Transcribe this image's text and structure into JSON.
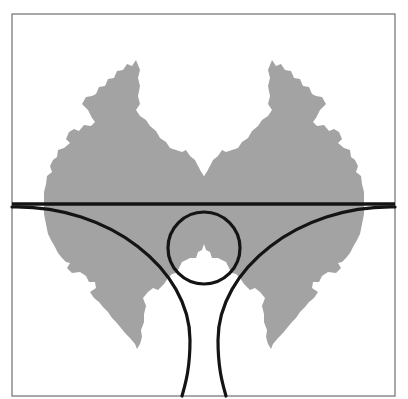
{
  "figure": {
    "colors": {
      "background": "#ffffff",
      "frame": "#6f6f6f",
      "fractal_fill": "#a3a3a3",
      "curves": "#141414"
    },
    "frame": {
      "x": 12,
      "y": 14,
      "width": 383,
      "height": 382
    },
    "horizontal_line": {
      "y": 204,
      "x1": 12,
      "x2": 395
    },
    "small_circle": {
      "cx": 204,
      "cy": 248,
      "r": 36
    },
    "arcs": [
      {
        "name": "left-arc",
        "from": [
          12,
          207
        ],
        "to": [
          182,
          396
        ]
      },
      {
        "name": "right-arc",
        "from": [
          395,
          207
        ],
        "to": [
          226,
          396
        ]
      }
    ],
    "fractal_region": {
      "cx": 204,
      "cy": 205,
      "approx_radius": 160
    }
  }
}
